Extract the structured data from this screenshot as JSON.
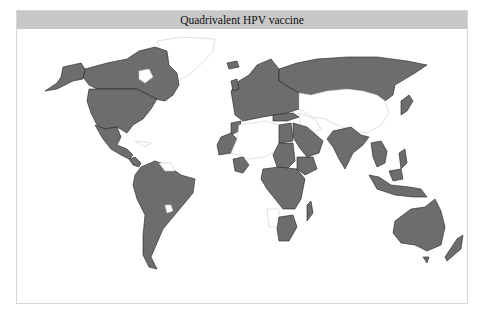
{
  "title": "Quadrivalent HPV vaccine",
  "colors": {
    "title_bar": "#c8c8c8",
    "introduced": "#6d6d6d",
    "not_introduced": "#ffffff",
    "border": "#222222"
  },
  "map": {
    "projection": "world",
    "shaded_regions": [
      "Canada",
      "United States",
      "Mexico",
      "Central America",
      "Colombia",
      "Venezuela",
      "Ecuador",
      "Peru",
      "Brazil",
      "Bolivia",
      "Paraguay",
      "Chile",
      "Argentina",
      "Uruguay",
      "Iceland",
      "Europe",
      "Russia",
      "Turkey",
      "Egypt",
      "Saudi Arabia",
      "Oman",
      "Morocco",
      "Mauritania",
      "Senegal",
      "Ghana",
      "Cameroon",
      "Nigeria",
      "Chad",
      "Sudan",
      "Ethiopia",
      "Kenya",
      "Uganda",
      "Tanzania",
      "Congo",
      "DR Congo",
      "Angola",
      "Madagascar",
      "South Africa",
      "Botswana",
      "India",
      "Nepal",
      "Bangladesh",
      "Myanmar",
      "Thailand",
      "Cambodia",
      "Vietnam",
      "Malaysia",
      "Philippines",
      "Indonesia",
      "Papua New Guinea",
      "Japan",
      "Australia",
      "New Zealand"
    ],
    "unshaded_regions": [
      "Greenland",
      "China",
      "Mongolia",
      "Kazakhstan",
      "Central Asia",
      "Iran",
      "Afghanistan",
      "Pakistan",
      "Libya",
      "Algeria",
      "Mali",
      "Niger",
      "Namibia",
      "Cuba",
      "Guyana"
    ]
  }
}
